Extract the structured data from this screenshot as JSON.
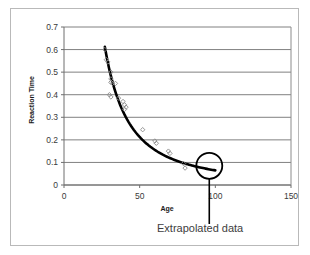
{
  "figure": {
    "frame_color": "#b9b9b9",
    "background": "#ffffff"
  },
  "chart_data": {
    "type": "scatter",
    "title": "",
    "xlabel": "Age",
    "ylabel": "Reaction Time",
    "xlim": [
      0,
      150
    ],
    "ylim": [
      0,
      0.7
    ],
    "xticks": [
      0,
      50,
      100,
      150
    ],
    "xtick_labels": [
      "0",
      "50",
      "100",
      "150"
    ],
    "yticks": [
      0,
      0.1,
      0.2,
      0.3,
      0.4,
      0.5,
      0.6,
      0.7
    ],
    "ytick_labels": [
      "0",
      "0.1",
      "0.2",
      "0.3",
      "0.4",
      "0.5",
      "0.6",
      "0.7"
    ],
    "grid": "horizontal",
    "grid_color": "#808080",
    "legend": "none",
    "marker": "open-diamond",
    "marker_color": "#8a8a8a",
    "points": [
      {
        "x": 27,
        "y": 0.6
      },
      {
        "x": 28,
        "y": 0.555
      },
      {
        "x": 29,
        "y": 0.545
      },
      {
        "x": 31,
        "y": 0.5
      },
      {
        "x": 31,
        "y": 0.47
      },
      {
        "x": 31,
        "y": 0.455
      },
      {
        "x": 32,
        "y": 0.45
      },
      {
        "x": 30,
        "y": 0.4
      },
      {
        "x": 31,
        "y": 0.39
      },
      {
        "x": 34,
        "y": 0.45
      },
      {
        "x": 36,
        "y": 0.385
      },
      {
        "x": 39,
        "y": 0.37
      },
      {
        "x": 40,
        "y": 0.355
      },
      {
        "x": 41,
        "y": 0.345
      },
      {
        "x": 40,
        "y": 0.335
      },
      {
        "x": 52,
        "y": 0.245
      },
      {
        "x": 60,
        "y": 0.195
      },
      {
        "x": 61,
        "y": 0.185
      },
      {
        "x": 69,
        "y": 0.15
      },
      {
        "x": 70,
        "y": 0.14
      },
      {
        "x": 79,
        "y": 0.095
      },
      {
        "x": 80,
        "y": 0.075
      }
    ],
    "fit_curve": {
      "name": "power-law decay fit",
      "color": "#000000",
      "width": 2.6,
      "x_start": 27,
      "x_end": 100,
      "description": "Thick black decreasing curve fitted through the points and extended beyond the data."
    },
    "annotations": [
      {
        "name": "extrapolated-data",
        "label": "Extrapolated data",
        "shape": "circle",
        "center_x": 96,
        "center_y": 0.085,
        "leader_line": true
      }
    ]
  },
  "axes": {
    "x_axis_title": "Age",
    "y_axis_title": "Reaction Time"
  },
  "annotation": {
    "extrapolated_label": "Extrapolated data"
  }
}
